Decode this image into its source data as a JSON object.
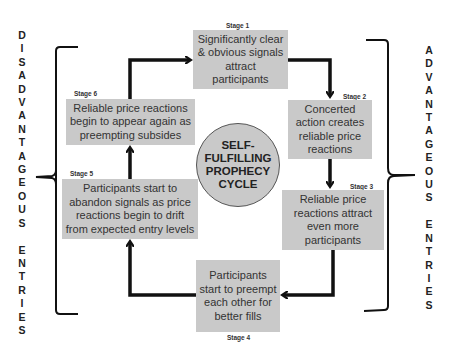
{
  "diagram": {
    "title": "SELF-\nFULFILLING\nPROPHECY\nCYCLE",
    "left_label": "D\nI\nS\nA\nD\nV\nA\nN\nT\nA\nG\nE\nO\nU\nS\n\nE\nN\nT\nR\nI\nE\nS",
    "right_label": "A\nD\nV\nA\nN\nT\nA\nG\nE\nO\nU\nS\n\nE\nN\nT\nR\nI\nE\nS",
    "stages": [
      {
        "label": "Stage 1",
        "text": "Significantly clear & obvious signals attract participants"
      },
      {
        "label": "Stage 2",
        "text": "Concerted action creates reliable price reactions"
      },
      {
        "label": "Stage 3",
        "text": "Reliable price reactions attract even more participants"
      },
      {
        "label": "Stage 4",
        "text": "Participants start to preempt each other for better fills"
      },
      {
        "label": "Stage 5",
        "text": "Participants start to abandon signals as price reactions begin to drift from expected entry levels"
      },
      {
        "label": "Stage 6",
        "text": "Reliable price reactions begin to appear again as preempting subsides"
      }
    ],
    "colors": {
      "box_fill": "#c9c9c9",
      "arrow": "#111111",
      "text": "#333333"
    }
  }
}
